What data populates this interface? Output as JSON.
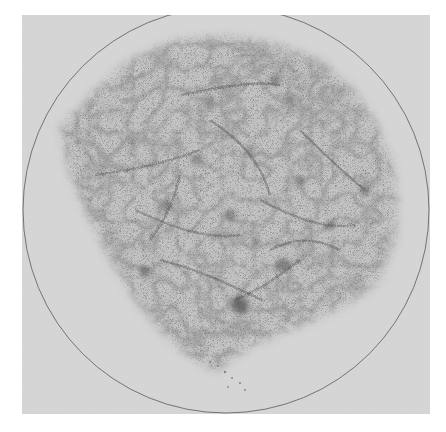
{
  "image": {
    "description": "Grayscale sky map of galaxy counts showing a speckled, filamentary distribution inside a thin circular boundary on a light gray plate",
    "width": 446,
    "height": 432
  },
  "plate": {
    "x": 22,
    "y": 15,
    "width": 408,
    "height": 399,
    "color": "#d6d6d6",
    "page_color": "#ffffff"
  },
  "circle": {
    "cx": 226,
    "cy": 210,
    "r": 203,
    "stroke": "#5a5a5a",
    "stroke_width": 0.8
  },
  "survey_region": {
    "fill_light": "#c4c4c4",
    "speckle_color": "#3a3a3a",
    "polygon": "60,128 90,95 130,60 175,40 230,35 280,45 320,60 350,85 375,120 392,160 398,200 395,240 380,280 355,300 320,318 290,330 255,345 230,360 215,372 190,358 160,330 135,300 110,260 85,210 70,175"
  },
  "clusters": [
    {
      "cx": 240,
      "cy": 305,
      "r": 9,
      "opacity": 0.55
    },
    {
      "cx": 283,
      "cy": 265,
      "r": 7,
      "opacity": 0.45
    },
    {
      "cx": 145,
      "cy": 272,
      "r": 6,
      "opacity": 0.4
    },
    {
      "cx": 275,
      "cy": 80,
      "r": 6,
      "opacity": 0.4
    },
    {
      "cx": 290,
      "cy": 100,
      "r": 5,
      "opacity": 0.35
    },
    {
      "cx": 365,
      "cy": 190,
      "r": 6,
      "opacity": 0.4
    },
    {
      "cx": 230,
      "cy": 215,
      "r": 6,
      "opacity": 0.4
    },
    {
      "cx": 195,
      "cy": 160,
      "r": 5,
      "opacity": 0.35
    },
    {
      "cx": 330,
      "cy": 225,
      "r": 5,
      "opacity": 0.35
    },
    {
      "cx": 210,
      "cy": 100,
      "r": 5,
      "opacity": 0.35
    },
    {
      "cx": 250,
      "cy": 150,
      "r": 5,
      "opacity": 0.35
    },
    {
      "cx": 165,
      "cy": 205,
      "r": 5,
      "opacity": 0.35
    },
    {
      "cx": 300,
      "cy": 180,
      "r": 5,
      "opacity": 0.35
    },
    {
      "cx": 255,
      "cy": 240,
      "r": 4,
      "opacity": 0.3
    },
    {
      "cx": 130,
      "cy": 140,
      "r": 4,
      "opacity": 0.3
    }
  ],
  "filaments": [
    "M95,175 C130,170 160,165 200,150",
    "M135,210 C170,225 200,240 240,235",
    "M160,260 C200,270 230,285 262,300",
    "M210,120 C240,140 260,160 270,195",
    "M260,200 C290,215 320,230 355,225",
    "M300,130 C320,150 340,170 365,190",
    "M180,95 C210,90 245,80 280,85",
    "M235,300 C260,290 280,275 300,260",
    "M150,240 C165,220 175,200 180,175",
    "M270,250 C290,240 310,235 340,250"
  ],
  "tail_spots": [
    {
      "cx": 225,
      "cy": 372,
      "r": 1.2
    },
    {
      "cx": 232,
      "cy": 378,
      "r": 1.0
    },
    {
      "cx": 240,
      "cy": 383,
      "r": 1.1
    },
    {
      "cx": 228,
      "cy": 387,
      "r": 0.9
    },
    {
      "cx": 245,
      "cy": 390,
      "r": 1.0
    },
    {
      "cx": 210,
      "cy": 362,
      "r": 1.0
    },
    {
      "cx": 218,
      "cy": 366,
      "r": 0.9
    }
  ]
}
